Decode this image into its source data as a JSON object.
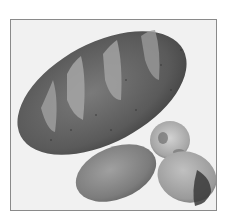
{
  "image": {
    "subject": "Grayscale photograph of bread: one large scored oval loaf and three small rolls",
    "items": [
      {
        "name": "large-loaf",
        "description": "Long oval loaf with four diagonal score marks"
      },
      {
        "name": "small-round-roll",
        "description": "Small round roll with light crumb"
      },
      {
        "name": "oval-roll",
        "description": "Smooth oval roll, lower center"
      },
      {
        "name": "broken-roll",
        "description": "Roll with dark torn end, lower right"
      }
    ],
    "colors": {
      "background": "#f1f1f1",
      "border": "#8a8a8a",
      "loaf_dark": "#4a4a4a",
      "loaf_mid": "#6e6e6e",
      "score_light": "#a8a8a8"
    }
  }
}
